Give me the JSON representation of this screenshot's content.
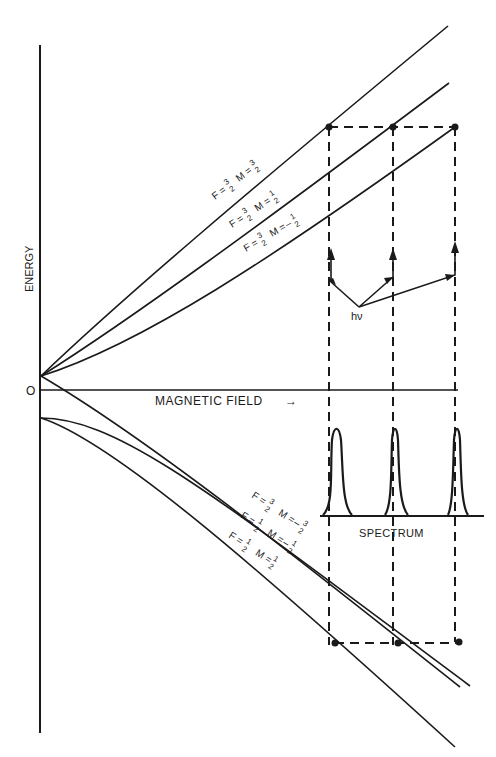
{
  "diagram": {
    "type": "zeeman_energy_level_diagram",
    "axes": {
      "y_label": "ENERGY",
      "origin_label": "O",
      "x_label": "MAGNETIC FIELD",
      "x_arrow": "→"
    },
    "photon_label": "hν",
    "spectrum_label": "SPECTRUM",
    "upper_levels": [
      {
        "F": "3/2",
        "M": "3/2",
        "label_F": "F =",
        "label_M": "M =",
        "F_num": "3",
        "F_den": "2",
        "M_sign": "",
        "M_num": "3",
        "M_den": "2"
      },
      {
        "F": "3/2",
        "M": "1/2",
        "label_F": "F =",
        "label_M": "M =",
        "F_num": "3",
        "F_den": "2",
        "M_sign": "",
        "M_num": "1",
        "M_den": "2"
      },
      {
        "F": "3/2",
        "M": "-1/2",
        "label_F": "F =",
        "label_M": "M =",
        "F_num": "3",
        "F_den": "2",
        "M_sign": "–",
        "M_num": "1",
        "M_den": "2"
      }
    ],
    "lower_levels": [
      {
        "F": "3/2",
        "M": "-3/2",
        "label_F": "F =",
        "label_M": "M =",
        "F_num": "3",
        "F_den": "2",
        "M_sign": "–",
        "M_num": "3",
        "M_den": "2"
      },
      {
        "F": "1/2",
        "M": "-1/2",
        "label_F": "F =",
        "label_M": "M =",
        "F_num": "1",
        "F_den": "2",
        "M_sign": "–",
        "M_num": "1",
        "M_den": "2"
      },
      {
        "F": "1/2",
        "M": "1/2",
        "label_F": "F =",
        "label_M": "M =",
        "F_num": "1",
        "F_den": "2",
        "M_sign": "",
        "M_num": "1",
        "M_den": "2"
      }
    ],
    "transitions": 3,
    "spectrum_peaks": 3,
    "colors": {
      "ink": "#1a1a1a",
      "background": "#ffffff"
    }
  }
}
